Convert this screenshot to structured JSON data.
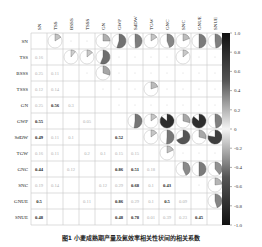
{
  "chart_data": {
    "type": "heatmap",
    "subtype": "correlation-matrix",
    "title": "",
    "caption": "图1  小麦成熟期产量及氮效率相关性状间的相关系数",
    "variables": [
      "SN",
      "TSS",
      "BSSS",
      "TSSS",
      "GN",
      "GWP",
      "SdDW",
      "TGW",
      "GNC",
      "SNC",
      "GNUE",
      "SNUE"
    ],
    "upper_triangle": "pie glyphs (significant correlations only)",
    "lower_triangle": "numeric coefficients",
    "lower_values": [
      [
        null,
        null,
        null,
        null,
        null,
        null,
        null,
        null,
        null,
        null,
        null,
        null
      ],
      [
        0.16,
        null,
        null,
        null,
        null,
        null,
        null,
        null,
        null,
        null,
        null,
        null
      ],
      [
        0.25,
        0.11,
        null,
        null,
        null,
        null,
        null,
        null,
        null,
        null,
        null,
        null
      ],
      [
        0.12,
        0.14,
        null,
        null,
        null,
        null,
        null,
        null,
        null,
        null,
        null,
        null
      ],
      [
        0.25,
        0.56,
        0.3,
        null,
        null,
        null,
        null,
        null,
        null,
        null,
        null,
        null
      ],
      [
        0.55,
        null,
        null,
        0.05,
        null,
        null,
        null,
        null,
        null,
        null,
        null,
        null
      ],
      [
        0.49,
        0.11,
        0.1,
        null,
        null,
        0.52,
        null,
        null,
        null,
        null,
        null,
        null
      ],
      [
        0.16,
        0.11,
        null,
        0.2,
        0.1,
        0.15,
        0.15,
        null,
        null,
        null,
        null,
        null
      ],
      [
        0.44,
        null,
        0.12,
        null,
        null,
        0.86,
        0.51,
        0.18,
        null,
        null,
        null,
        null
      ],
      [
        0.19,
        0.14,
        null,
        null,
        0.12,
        0.29,
        0.68,
        0.1,
        0.43,
        null,
        null,
        null
      ],
      [
        0.5,
        null,
        null,
        0.11,
        null,
        0.86,
        0.29,
        0.1,
        0.5,
        0.09,
        null,
        null
      ],
      [
        0.48,
        null,
        null,
        null,
        null,
        0.48,
        0.78,
        0.01,
        0.39,
        0.23,
        0.45,
        null
      ]
    ],
    "upper_values": [
      [
        null,
        0.16,
        null,
        null,
        0.25,
        0.55,
        0.49,
        0.16,
        0.44,
        0.19,
        0.5,
        0.48
      ],
      [
        null,
        null,
        0.11,
        0.14,
        0.56,
        null,
        null,
        null,
        null,
        0.14,
        null,
        null
      ],
      [
        null,
        null,
        null,
        null,
        0.3,
        null,
        null,
        null,
        null,
        null,
        null,
        null
      ],
      [
        null,
        null,
        null,
        null,
        null,
        null,
        null,
        0.2,
        null,
        null,
        null,
        null
      ],
      [
        null,
        null,
        null,
        null,
        null,
        null,
        null,
        null,
        null,
        null,
        null,
        null
      ],
      [
        null,
        null,
        null,
        null,
        null,
        null,
        0.52,
        0.15,
        0.86,
        0.29,
        0.86,
        0.48
      ],
      [
        null,
        null,
        null,
        null,
        null,
        null,
        null,
        0.15,
        0.51,
        0.68,
        0.29,
        0.78
      ],
      [
        null,
        null,
        null,
        null,
        null,
        null,
        null,
        null,
        0.18,
        null,
        null,
        null
      ],
      [
        null,
        null,
        null,
        null,
        null,
        null,
        null,
        null,
        null,
        0.43,
        0.5,
        0.39
      ],
      [
        null,
        null,
        null,
        null,
        null,
        null,
        null,
        null,
        null,
        null,
        null,
        0.23
      ],
      [
        null,
        null,
        null,
        null,
        null,
        null,
        null,
        null,
        null,
        null,
        null,
        0.45
      ],
      [
        null,
        null,
        null,
        null,
        null,
        null,
        null,
        null,
        null,
        null,
        null,
        null
      ]
    ],
    "colorbar": {
      "min": -1.0,
      "max": 1.0,
      "ticks": [
        "1.0",
        "0.8",
        "0.6",
        "0.4",
        "0.2",
        "0",
        "-0.2",
        "-0.4",
        "-0.6",
        "-0.8",
        "-1.0"
      ]
    },
    "legend_position": "right",
    "grid": true
  },
  "colors": {
    "grid": "#c8c8c8",
    "strong": "#1a1a1a",
    "mid": "#555555",
    "weak": "#999999",
    "circle": "#bbbbbb"
  }
}
